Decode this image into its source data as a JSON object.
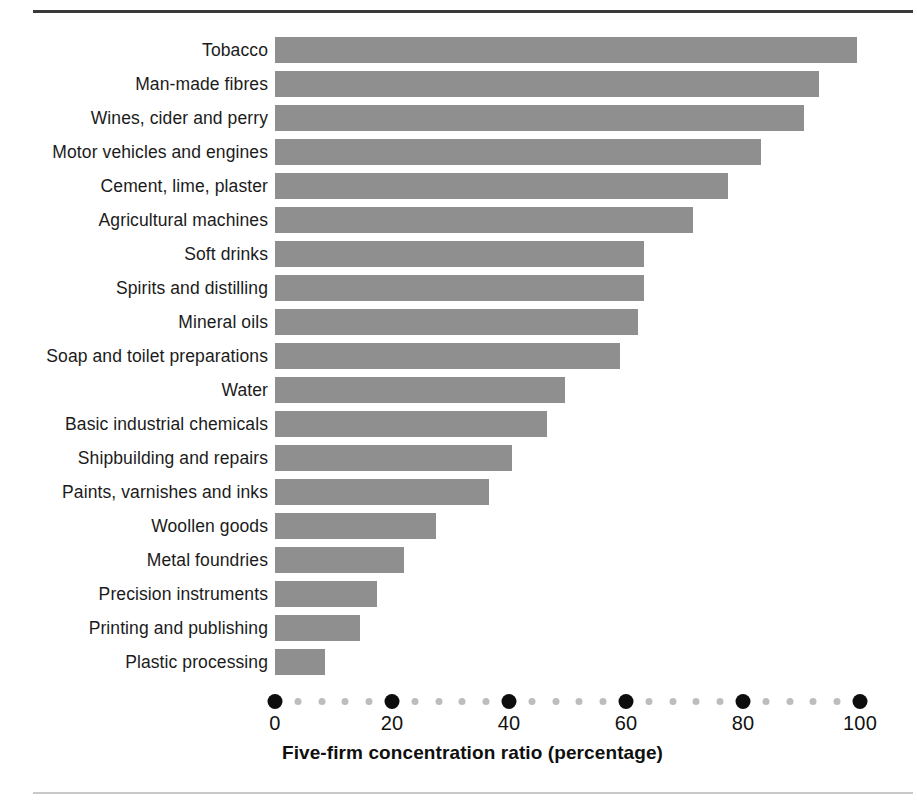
{
  "figure": {
    "axis_title": "Five-firm concentration ratio (percentage)",
    "bar_color": "#8f8f8f",
    "major_tick_color": "#0d0d0d",
    "minor_tick_color": "#bdbdbd",
    "rule_color": "#3a3a3a"
  },
  "chart_data": {
    "type": "bar",
    "orientation": "horizontal",
    "title": "",
    "subtitle": "",
    "xlabel": "Five-firm concentration ratio (percentage)",
    "ylabel": "",
    "xlim": [
      0,
      100
    ],
    "xticks": [
      0,
      20,
      40,
      60,
      80,
      100
    ],
    "xticklabels": [
      "0",
      "20",
      "40",
      "60",
      "80",
      "100"
    ],
    "minor_tick_step": 4,
    "grid": false,
    "legend": null,
    "categories": [
      "Tobacco",
      "Man-made fibres",
      "Wines, cider and perry",
      "Motor vehicles and engines",
      "Cement, lime, plaster",
      "Agricultural machines",
      "Soft drinks",
      "Spirits and distilling",
      "Mineral oils",
      "Soap and toilet preparations",
      "Water",
      "Basic industrial chemicals",
      "Shipbuilding and repairs",
      "Paints, varnishes and inks",
      "Woollen goods",
      "Metal foundries",
      "Precision instruments",
      "Printing and publishing",
      "Plastic processing"
    ],
    "values": [
      99.5,
      93,
      90.5,
      83,
      77.5,
      71.5,
      63,
      63,
      62,
      59,
      49.5,
      46.5,
      40.5,
      36.5,
      27.5,
      22,
      17.5,
      14.5,
      8.5
    ]
  }
}
